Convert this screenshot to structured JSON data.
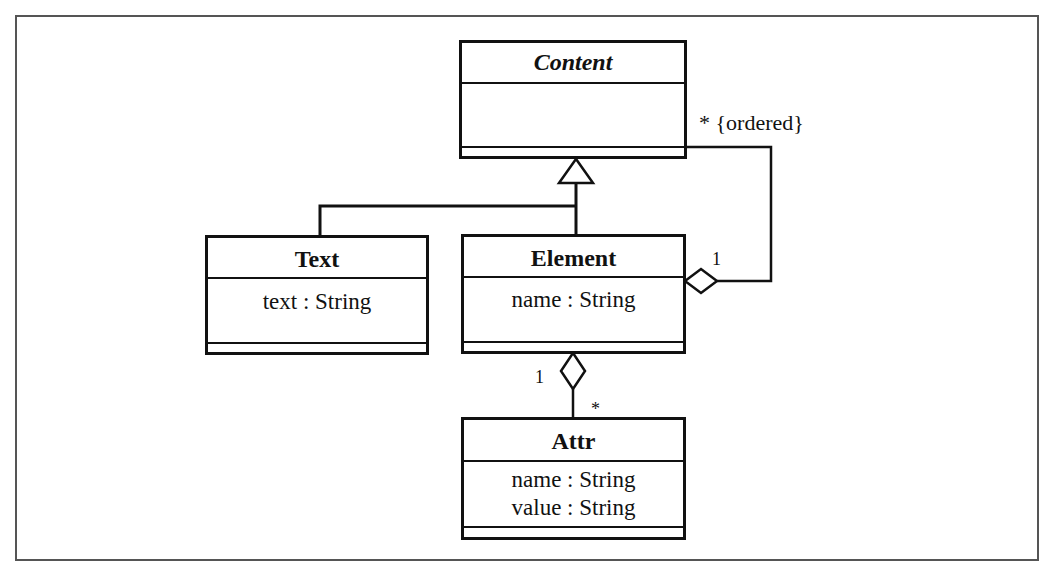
{
  "diagram": {
    "type": "UML class diagram",
    "classes": [
      {
        "id": "content",
        "name": "Content",
        "abstract": true,
        "attributes": [],
        "operations": []
      },
      {
        "id": "text",
        "name": "Text",
        "abstract": false,
        "attributes": [
          "text : String"
        ],
        "operations": []
      },
      {
        "id": "element",
        "name": "Element",
        "abstract": false,
        "attributes": [
          "name : String"
        ],
        "operations": []
      },
      {
        "id": "attr",
        "name": "Attr",
        "abstract": false,
        "attributes": [
          "name : String",
          "value : String"
        ],
        "operations": []
      }
    ],
    "relationships": [
      {
        "type": "generalization",
        "from": "text",
        "to": "content"
      },
      {
        "type": "generalization",
        "from": "element",
        "to": "content"
      },
      {
        "type": "aggregation",
        "whole": "element",
        "part": "content",
        "whole_multiplicity": "1",
        "part_multiplicity": "* {ordered}"
      },
      {
        "type": "aggregation",
        "whole": "element",
        "part": "attr",
        "whole_multiplicity": "1",
        "part_multiplicity": "*"
      }
    ],
    "labels": {
      "content_children_multiplicity": "* {ordered}",
      "element_parent_multiplicity": "1",
      "element_attr_whole_multiplicity": "1",
      "element_attr_part_multiplicity": "*"
    }
  }
}
